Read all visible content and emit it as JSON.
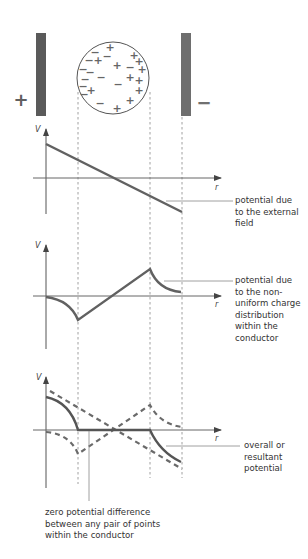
{
  "plates": {
    "left_sign": "+",
    "right_sign": "−"
  },
  "conductor": {
    "charges": [
      {
        "sign": "−",
        "x": -18,
        "y": -26
      },
      {
        "sign": "+",
        "x": -3,
        "y": -31
      },
      {
        "sign": "−",
        "x": -24,
        "y": -18
      },
      {
        "sign": "+",
        "x": -15,
        "y": -18
      },
      {
        "sign": "−",
        "x": -6,
        "y": -22
      },
      {
        "sign": "+",
        "x": 4,
        "y": -13
      },
      {
        "sign": "+",
        "x": 21,
        "y": -23
      },
      {
        "sign": "+",
        "x": 26,
        "y": -17
      },
      {
        "sign": "−",
        "x": 17,
        "y": -11
      },
      {
        "sign": "+",
        "x": 29,
        "y": -9
      },
      {
        "sign": "−",
        "x": -30,
        "y": -9
      },
      {
        "sign": "−",
        "x": -23,
        "y": -6
      },
      {
        "sign": "−",
        "x": -28,
        "y": 1
      },
      {
        "sign": "−",
        "x": -12,
        "y": -1
      },
      {
        "sign": "+",
        "x": 17,
        "y": -1
      },
      {
        "sign": "+",
        "x": 26,
        "y": 2
      },
      {
        "sign": "−",
        "x": 5,
        "y": 6
      },
      {
        "sign": "−",
        "x": -30,
        "y": 8
      },
      {
        "sign": "+",
        "x": -22,
        "y": 12
      },
      {
        "sign": "−",
        "x": -29,
        "y": 16
      },
      {
        "sign": "+",
        "x": 26,
        "y": 12
      },
      {
        "sign": "+",
        "x": 17,
        "y": 22
      },
      {
        "sign": "−",
        "x": -13,
        "y": 25
      },
      {
        "sign": "+",
        "x": 4,
        "y": 30
      }
    ]
  },
  "graphs": [
    {
      "id": "external",
      "y_label": "V",
      "x_label": "r",
      "caption": "potential due\nto the external\nfield",
      "curve": "linear decreasing: positive at left plate, zero at conductor centre, negative at right plate"
    },
    {
      "id": "induced",
      "y_label": "V",
      "x_label": "r",
      "caption": "potential due\nto the non-\nuniform charge\ndistribution\nwithin the\nconductor",
      "curve": "dips negative to the left conductor surface, rises linearly to a positive peak at the right surface, decays to zero"
    },
    {
      "id": "resultant",
      "y_label": "V",
      "x_label": "r",
      "caption": "overall or\nresultant\npotential",
      "curve": "falls from positive to zero at left surface, flat zero inside conductor, falls negative after right surface",
      "dashed_components": [
        "external",
        "induced"
      ]
    }
  ],
  "bottom_note": "zero potential difference\nbetween any pair of points\nwithin the conductor",
  "colors": {
    "plate_left": "#5a5a5a",
    "plate_right": "#6e6e6e",
    "curve": "#616161",
    "axis": "#555555",
    "guide": "#888888"
  }
}
